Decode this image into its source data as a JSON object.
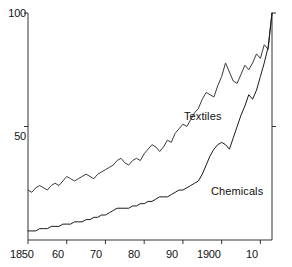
{
  "chart_data": {
    "type": "line",
    "title": "",
    "subtitle": "",
    "xlabel": "",
    "ylabel": "",
    "xlim": [
      1850,
      1913
    ],
    "ylim": [
      0,
      100
    ],
    "grid": false,
    "legend_position": "inline-annotations",
    "x_tick_values": [
      1850,
      1860,
      1870,
      1880,
      1890,
      1900,
      1910
    ],
    "x_tick_labels": [
      "1850",
      "60",
      "70",
      "80",
      "90",
      "1900",
      "10"
    ],
    "y_tick_values": [
      50,
      100
    ],
    "y_tick_labels": [
      "50",
      "100"
    ],
    "annotations": [
      {
        "text": "Textiles",
        "x": 1893,
        "y": 62
      },
      {
        "text": "Chemicals",
        "x": 1899,
        "y": 29
      }
    ],
    "series": [
      {
        "name": "Textiles",
        "color": "#3a3a3a",
        "x": [
          1850,
          1851,
          1852,
          1853,
          1854,
          1855,
          1856,
          1857,
          1858,
          1859,
          1860,
          1861,
          1862,
          1863,
          1864,
          1865,
          1866,
          1867,
          1868,
          1869,
          1870,
          1871,
          1872,
          1873,
          1874,
          1875,
          1876,
          1877,
          1878,
          1879,
          1880,
          1881,
          1882,
          1883,
          1884,
          1885,
          1886,
          1887,
          1888,
          1889,
          1890,
          1891,
          1892,
          1893,
          1894,
          1895,
          1896,
          1897,
          1898,
          1899,
          1900,
          1901,
          1902,
          1903,
          1904,
          1905,
          1906,
          1907,
          1908,
          1909,
          1910,
          1911,
          1912,
          1913
        ],
        "values": [
          22,
          21,
          23,
          24,
          23,
          22,
          24,
          25,
          24,
          26,
          28,
          27,
          26,
          27,
          28,
          29,
          28,
          27,
          29,
          30,
          31,
          32,
          33,
          35,
          36,
          34,
          33,
          35,
          36,
          35,
          38,
          40,
          42,
          41,
          39,
          41,
          44,
          43,
          47,
          49,
          51,
          50,
          53,
          56,
          58,
          62,
          65,
          64,
          63,
          68,
          72,
          78,
          74,
          70,
          69,
          73,
          77,
          75,
          78,
          82,
          80,
          86,
          84,
          100
        ]
      },
      {
        "name": "Chemicals",
        "color": "#1a1a1a",
        "x": [
          1850,
          1851,
          1852,
          1853,
          1854,
          1855,
          1856,
          1857,
          1858,
          1859,
          1860,
          1861,
          1862,
          1863,
          1864,
          1865,
          1866,
          1867,
          1868,
          1869,
          1870,
          1871,
          1872,
          1873,
          1874,
          1875,
          1876,
          1877,
          1878,
          1879,
          1880,
          1881,
          1882,
          1883,
          1884,
          1885,
          1886,
          1887,
          1888,
          1889,
          1890,
          1891,
          1892,
          1893,
          1894,
          1895,
          1896,
          1897,
          1898,
          1899,
          1900,
          1901,
          1902,
          1903,
          1904,
          1905,
          1906,
          1907,
          1908,
          1909,
          1910,
          1911,
          1912,
          1913
        ],
        "values": [
          4,
          4,
          4,
          5,
          5,
          5,
          6,
          6,
          6,
          7,
          7,
          7,
          8,
          8,
          8,
          9,
          9,
          10,
          10,
          11,
          11,
          12,
          13,
          14,
          14,
          14,
          14,
          15,
          15,
          16,
          16,
          17,
          17,
          18,
          19,
          19,
          19,
          20,
          21,
          22,
          22,
          23,
          24,
          25,
          26,
          29,
          33,
          37,
          40,
          42,
          43,
          42,
          40,
          45,
          50,
          55,
          59,
          64,
          62,
          66,
          72,
          78,
          85,
          100
        ]
      }
    ]
  },
  "axes": {
    "y_labels": [
      {
        "text": "100",
        "top": 7,
        "left": 0,
        "width": 26
      },
      {
        "text": "50",
        "top": 130,
        "left": 0,
        "width": 26
      }
    ],
    "x_labels": [
      {
        "text": "1850",
        "left": 10,
        "top": 248
      },
      {
        "text": "60",
        "left": 52,
        "top": 248
      },
      {
        "text": "70",
        "left": 90,
        "top": 248
      },
      {
        "text": "80",
        "left": 128,
        "top": 248
      },
      {
        "text": "90",
        "left": 166,
        "top": 248
      },
      {
        "text": "1900",
        "left": 197,
        "top": 248
      },
      {
        "text": "10",
        "left": 246,
        "top": 248
      }
    ]
  },
  "labels": {
    "textiles": {
      "text": "Textiles",
      "left": 184,
      "top": 110
    },
    "chemicals": {
      "text": "Chemicals",
      "left": 211,
      "top": 185
    }
  }
}
